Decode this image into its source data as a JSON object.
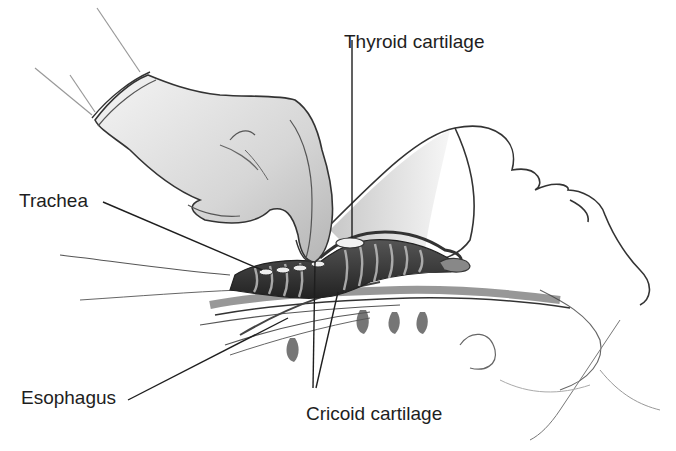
{
  "figure": {
    "labels": {
      "thyroid": "Thyroid cartilage",
      "trachea": "Trachea",
      "esophagus": "Esophagus",
      "cricoid": "Cricoid cartilage"
    },
    "colors": {
      "ink": "#1e1e1e",
      "shade_dark": "#3a3a3a",
      "shade_mid": "#8a8a8a",
      "shade_light": "#cfcfcf",
      "background": "#ffffff"
    }
  }
}
